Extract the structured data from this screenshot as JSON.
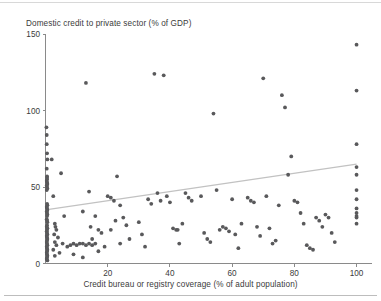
{
  "figure": {
    "name": "scatter-plot-figure",
    "background_color": "#ffffff",
    "point_color": "#59595b",
    "trend_line_color": "#c2c2c2",
    "axis_color": "#8a8a8a"
  },
  "axes": {
    "y_title": "Domestic credit to private sector (% of GDP)",
    "x_title": "Credit bureau or registry coverage (% of adult population)",
    "y_ticks": [
      "0",
      "50",
      "100",
      "150"
    ],
    "x_ticks": [
      "20",
      "40",
      "60",
      "80",
      "100"
    ]
  },
  "chart_data": {
    "type": "scatter",
    "title": "",
    "xlabel": "Credit bureau or registry coverage (% of adult population)",
    "ylabel": "Domestic credit to private sector (% of GDP)",
    "xlim": [
      0,
      104
    ],
    "ylim": [
      0,
      150
    ],
    "xticks": [
      20,
      40,
      60,
      80,
      100
    ],
    "yticks": [
      0,
      50,
      100,
      150
    ],
    "grid": false,
    "legend": null,
    "trend_line": {
      "type": "line",
      "name": "linear fit",
      "x": [
        0,
        100
      ],
      "y": [
        35,
        65
      ],
      "color": "#c2c2c2"
    },
    "series": [
      {
        "name": "Countries",
        "marker": "circle",
        "color": "#59595b",
        "points": [
          [
            0.3,
            89
          ],
          [
            0.4,
            84
          ],
          [
            0.4,
            78
          ],
          [
            0.5,
            72
          ],
          [
            0.6,
            68
          ],
          [
            0.4,
            62
          ],
          [
            0.5,
            57
          ],
          [
            0.5,
            56
          ],
          [
            0.5,
            55
          ],
          [
            0.4,
            54
          ],
          [
            0.5,
            53
          ],
          [
            0.6,
            52
          ],
          [
            0.4,
            51
          ],
          [
            0.5,
            50
          ],
          [
            0.6,
            49
          ],
          [
            0.4,
            48
          ],
          [
            0.5,
            39
          ],
          [
            0.6,
            38
          ],
          [
            0.4,
            37
          ],
          [
            0.5,
            36
          ],
          [
            0.6,
            35
          ],
          [
            0.4,
            34
          ],
          [
            0.5,
            33
          ],
          [
            0.6,
            32
          ],
          [
            0.5,
            31
          ],
          [
            0.4,
            29
          ],
          [
            0.5,
            28
          ],
          [
            0.6,
            27
          ],
          [
            0.5,
            25
          ],
          [
            0.4,
            24
          ],
          [
            0.6,
            23
          ],
          [
            0.5,
            22
          ],
          [
            0.4,
            21
          ],
          [
            0.5,
            20
          ],
          [
            0.6,
            19
          ],
          [
            0.4,
            18
          ],
          [
            0.5,
            17
          ],
          [
            0.6,
            16
          ],
          [
            0.5,
            15
          ],
          [
            0.4,
            14
          ],
          [
            0.5,
            13
          ],
          [
            0.6,
            12
          ],
          [
            0.4,
            11
          ],
          [
            0.5,
            10
          ],
          [
            0.6,
            9
          ],
          [
            0.5,
            8
          ],
          [
            0.4,
            7
          ],
          [
            0.5,
            6
          ],
          [
            0.6,
            5
          ],
          [
            0.5,
            4
          ],
          [
            0.4,
            3
          ],
          [
            0.6,
            2
          ],
          [
            2.0,
            68
          ],
          [
            2.5,
            44
          ],
          [
            3.0,
            26
          ],
          [
            3.2,
            24
          ],
          [
            3.5,
            22
          ],
          [
            2.8,
            19
          ],
          [
            4.0,
            17
          ],
          [
            3.0,
            14
          ],
          [
            3.5,
            12
          ],
          [
            2.5,
            9
          ],
          [
            4.5,
            7
          ],
          [
            3.0,
            5
          ],
          [
            5.0,
            59
          ],
          [
            6.0,
            31
          ],
          [
            5.5,
            13
          ],
          [
            7.0,
            11
          ],
          [
            8.0,
            12
          ],
          [
            9.0,
            13
          ],
          [
            10.0,
            12
          ],
          [
            11.0,
            13
          ],
          [
            12.0,
            13
          ],
          [
            13.0,
            12
          ],
          [
            14.0,
            13
          ],
          [
            15.0,
            12
          ],
          [
            16.0,
            13
          ],
          [
            9.0,
            6
          ],
          [
            12.0,
            4
          ],
          [
            13.0,
            118
          ],
          [
            14.0,
            47
          ],
          [
            12.0,
            34
          ],
          [
            16.0,
            31
          ],
          [
            14.5,
            24
          ],
          [
            17.0,
            22
          ],
          [
            18.0,
            20
          ],
          [
            15.0,
            16
          ],
          [
            19.0,
            11
          ],
          [
            17.0,
            8
          ],
          [
            20.0,
            44
          ],
          [
            21.0,
            43
          ],
          [
            22.0,
            41
          ],
          [
            23.0,
            57
          ],
          [
            24.0,
            38
          ],
          [
            25.0,
            30
          ],
          [
            22.5,
            28
          ],
          [
            26.0,
            25
          ],
          [
            21.0,
            22
          ],
          [
            27.0,
            16
          ],
          [
            24.0,
            13
          ],
          [
            30.0,
            27
          ],
          [
            31.0,
            19
          ],
          [
            32.0,
            11
          ],
          [
            33.0,
            42
          ],
          [
            34.0,
            39
          ],
          [
            35.0,
            124
          ],
          [
            36.0,
            46
          ],
          [
            37.0,
            41
          ],
          [
            38.0,
            123
          ],
          [
            39.0,
            44
          ],
          [
            40.0,
            40
          ],
          [
            41.0,
            23
          ],
          [
            42.0,
            22
          ],
          [
            42.5,
            22
          ],
          [
            43.0,
            13
          ],
          [
            44.0,
            26
          ],
          [
            45.0,
            46
          ],
          [
            46.0,
            43
          ],
          [
            47.0,
            41
          ],
          [
            50.0,
            44
          ],
          [
            51.0,
            20
          ],
          [
            52.0,
            16
          ],
          [
            53.0,
            14
          ],
          [
            54.0,
            98
          ],
          [
            55.0,
            48
          ],
          [
            56.0,
            22
          ],
          [
            57.0,
            24
          ],
          [
            58.0,
            23
          ],
          [
            59.0,
            21
          ],
          [
            60.0,
            42
          ],
          [
            61.0,
            19
          ],
          [
            62.0,
            10
          ],
          [
            63.0,
            26
          ],
          [
            65.0,
            43
          ],
          [
            66.0,
            41
          ],
          [
            67.0,
            40
          ],
          [
            68.0,
            24
          ],
          [
            69.0,
            18
          ],
          [
            70.0,
            121
          ],
          [
            71.0,
            44
          ],
          [
            72.0,
            23
          ],
          [
            73.0,
            13
          ],
          [
            74.0,
            15
          ],
          [
            75.0,
            38
          ],
          [
            76.0,
            110
          ],
          [
            77.0,
            102
          ],
          [
            78.0,
            58
          ],
          [
            79.0,
            70
          ],
          [
            80.0,
            41
          ],
          [
            81.0,
            40
          ],
          [
            82.0,
            33
          ],
          [
            83.0,
            26
          ],
          [
            84.0,
            12
          ],
          [
            85.0,
            10
          ],
          [
            86.0,
            9
          ],
          [
            87.0,
            30
          ],
          [
            88.0,
            28
          ],
          [
            89.0,
            24
          ],
          [
            90.0,
            32
          ],
          [
            91.0,
            30
          ],
          [
            92.0,
            20
          ],
          [
            93.0,
            14
          ],
          [
            100.0,
            143
          ],
          [
            100.0,
            113
          ],
          [
            100.0,
            78
          ],
          [
            100.0,
            63
          ],
          [
            100.0,
            58
          ],
          [
            100.0,
            48
          ],
          [
            100.0,
            42
          ],
          [
            100.0,
            36
          ],
          [
            100.0,
            33
          ],
          [
            100.0,
            31
          ],
          [
            100.0,
            30
          ],
          [
            100.0,
            26
          ]
        ]
      }
    ]
  }
}
